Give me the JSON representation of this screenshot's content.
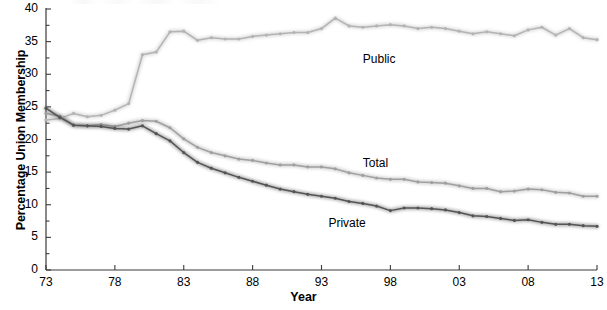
{
  "chart_data": {
    "type": "line",
    "title": "",
    "xlabel": "Year",
    "ylabel": "Percentage Union Membership",
    "xlim": [
      1973,
      2013
    ],
    "ylim": [
      0,
      40
    ],
    "grid": false,
    "legend_position": "inline-annotations",
    "x_tick_labels": [
      "73",
      "78",
      "83",
      "88",
      "93",
      "98",
      "03",
      "08",
      "13"
    ],
    "x_tick_values": [
      1973,
      1978,
      1983,
      1988,
      1993,
      1998,
      2003,
      2008,
      2013
    ],
    "y_tick_labels": [
      "0",
      "5",
      "10",
      "15",
      "20",
      "25",
      "30",
      "35",
      "40"
    ],
    "y_tick_values": [
      0,
      5,
      10,
      15,
      20,
      25,
      30,
      35,
      40
    ],
    "y_minor_tick_interval": 2.5,
    "x": [
      1973,
      1974,
      1975,
      1976,
      1977,
      1978,
      1979,
      1980,
      1981,
      1982,
      1983,
      1984,
      1985,
      1986,
      1987,
      1988,
      1989,
      1990,
      1991,
      1992,
      1993,
      1994,
      1995,
      1996,
      1997,
      1998,
      1999,
      2000,
      2001,
      2002,
      2003,
      2004,
      2005,
      2006,
      2007,
      2008,
      2009,
      2010,
      2011,
      2012,
      2013
    ],
    "series": [
      {
        "name": "Public",
        "color": "#b4b4b4",
        "values": [
          23.0,
          23.2,
          24.0,
          23.5,
          23.7,
          24.5,
          25.5,
          33.0,
          33.4,
          36.5,
          36.6,
          35.2,
          35.6,
          35.4,
          35.4,
          35.8,
          36.0,
          36.2,
          36.4,
          36.4,
          37.0,
          38.6,
          37.4,
          37.2,
          37.4,
          37.6,
          37.4,
          37.0,
          37.2,
          37.0,
          36.6,
          36.2,
          36.5,
          36.2,
          35.9,
          36.8,
          37.2,
          36.0,
          37.0,
          35.6,
          35.3
        ]
      },
      {
        "name": "Total",
        "color": "#a0a0a0",
        "values": [
          24.0,
          23.6,
          22.2,
          22.1,
          22.3,
          22.0,
          22.5,
          22.9,
          22.8,
          21.8,
          20.1,
          18.8,
          18.0,
          17.5,
          17.0,
          16.8,
          16.4,
          16.1,
          16.1,
          15.8,
          15.8,
          15.5,
          14.9,
          14.5,
          14.1,
          13.9,
          13.9,
          13.5,
          13.4,
          13.3,
          12.9,
          12.5,
          12.5,
          12.0,
          12.1,
          12.4,
          12.3,
          11.9,
          11.8,
          11.3,
          11.3
        ]
      },
      {
        "name": "Private",
        "color": "#555555",
        "values": [
          24.8,
          23.4,
          22.2,
          22.1,
          22.0,
          21.7,
          21.6,
          22.1,
          20.9,
          19.8,
          18.0,
          16.5,
          15.6,
          14.9,
          14.2,
          13.6,
          13.0,
          12.4,
          12.0,
          11.6,
          11.3,
          11.0,
          10.5,
          10.2,
          9.8,
          9.1,
          9.5,
          9.5,
          9.4,
          9.2,
          8.8,
          8.3,
          8.2,
          7.9,
          7.6,
          7.7,
          7.3,
          7.0,
          7.0,
          6.8,
          6.7
        ]
      }
    ],
    "annotations": [
      {
        "text": "Public",
        "x": 1996.0,
        "y": 32.2
      },
      {
        "text": "Total",
        "x": 1996.0,
        "y": 16.3
      },
      {
        "text": "Private",
        "x": 1993.5,
        "y": 7.1
      }
    ]
  },
  "axis": {
    "y_title": "Percentage Union Membership",
    "x_title": "Year"
  },
  "colors": {
    "public": "#b4b4b4",
    "total": "#a0a0a0",
    "private": "#555555",
    "axis": "#3a3a3a",
    "background": "#ffffff"
  }
}
